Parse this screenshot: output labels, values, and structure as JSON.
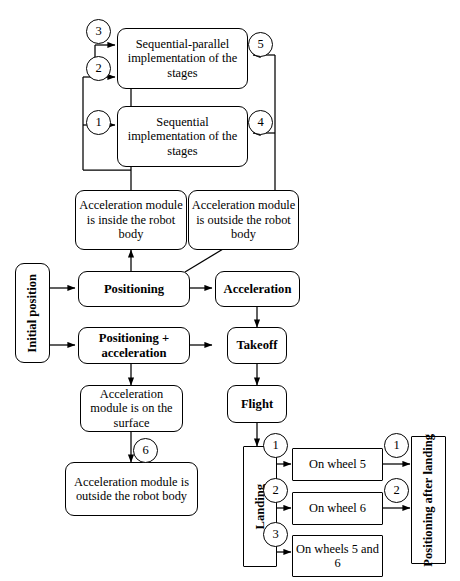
{
  "diagram": {
    "line_color": "#000000",
    "background_color": "#ffffff",
    "nodes": {
      "seq_parallel": "Sequential-parallel implementation of the stages",
      "sequential": "Sequential implementation of the stages",
      "accel_inside": "Acceleration module is inside the robot body",
      "accel_outside_top": "Acceleration module is outside the robot body",
      "initial_position": "Initial position",
      "positioning": "Positioning",
      "acceleration": "Acceleration",
      "positioning_acceleration": "Positioning + acceleration",
      "takeoff": "Takeoff",
      "flight": "Flight",
      "accel_surface": "Acceleration module is on the surface",
      "accel_outside_bottom": "Acceleration module is outside the robot body",
      "landing": "Landing",
      "on_wheel_5": "On wheel 5",
      "on_wheel_6": "On wheel 6",
      "on_wheels_5_and_6": "On wheels 5 and 6",
      "positioning_after_landing": "Positioning after landing"
    },
    "badges": {
      "b3": "3",
      "b2": "2",
      "b5": "5",
      "b1": "1",
      "b4": "4",
      "b6": "6",
      "land1": "1",
      "land2": "2",
      "land3": "3",
      "out1": "1",
      "out2": "2"
    }
  }
}
